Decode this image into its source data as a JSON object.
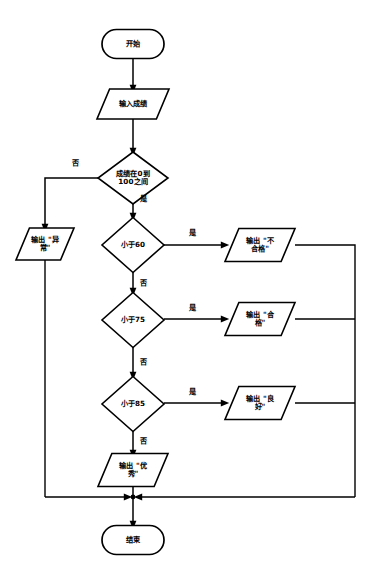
{
  "diagram": {
    "type": "flowchart",
    "language": "zh-CN",
    "background_color": "#ffffff",
    "line_color": "#000000",
    "text_color": "#000000",
    "canvas": {
      "width": 373,
      "height": 580
    }
  },
  "nodes": [
    {
      "id": "start",
      "shape": "terminal",
      "label": "开始",
      "lines": [
        "开始"
      ],
      "cx": 133,
      "cy": 44,
      "w": 62,
      "h": 29
    },
    {
      "id": "input_score",
      "shape": "parallelogram",
      "label": "输入成绩",
      "lines": [
        "输入成绩"
      ],
      "cx": 133,
      "cy": 104,
      "w": 72,
      "h": 30
    },
    {
      "id": "range_check",
      "shape": "diamond",
      "label": "成绩在0到100之间",
      "lines": [
        "成绩在0到",
        "100之间"
      ],
      "cx": 133,
      "cy": 178,
      "w": 70,
      "h": 52
    },
    {
      "id": "out_abnormal",
      "shape": "parallelogram",
      "label": "输出 \"异常\"",
      "lines": [
        "输出 \"异",
        "常\""
      ],
      "cx": 45,
      "cy": 244,
      "w": 58,
      "h": 32
    },
    {
      "id": "lt60",
      "shape": "diamond",
      "label": "小于60",
      "lines": [
        "小于60"
      ],
      "cx": 133,
      "cy": 245,
      "w": 62,
      "h": 55
    },
    {
      "id": "out_fail",
      "shape": "parallelogram",
      "label": "输出 \"不合格\"",
      "lines": [
        "输出 \"不",
        "合格\""
      ],
      "cx": 260,
      "cy": 245,
      "w": 70,
      "h": 33
    },
    {
      "id": "lt75",
      "shape": "diamond",
      "label": "小于75",
      "lines": [
        "小于75"
      ],
      "cx": 133,
      "cy": 320,
      "w": 62,
      "h": 55
    },
    {
      "id": "out_pass",
      "shape": "parallelogram",
      "label": "输出 \"合格\"",
      "lines": [
        "输出 \"合",
        "格\""
      ],
      "cx": 260,
      "cy": 319,
      "w": 70,
      "h": 33
    },
    {
      "id": "lt85",
      "shape": "diamond",
      "label": "小于85",
      "lines": [
        "小于85"
      ],
      "cx": 133,
      "cy": 404,
      "w": 62,
      "h": 55
    },
    {
      "id": "out_good",
      "shape": "parallelogram",
      "label": "输出 \"良好\"",
      "lines": [
        "输出 \"良",
        "好\""
      ],
      "cx": 260,
      "cy": 403,
      "w": 70,
      "h": 33
    },
    {
      "id": "out_excellent",
      "shape": "parallelogram",
      "label": "输出 \"优秀\"",
      "lines": [
        "输出 \"优",
        "秀\""
      ],
      "cx": 133,
      "cy": 470,
      "w": 70,
      "h": 33
    },
    {
      "id": "end",
      "shape": "terminal",
      "label": "结束",
      "lines": [
        "结束"
      ],
      "cx": 133,
      "cy": 540,
      "w": 62,
      "h": 29
    }
  ],
  "edges": [
    {
      "id": "e_start_input",
      "from": "start",
      "to": "input_score",
      "label": "",
      "path": "M133,58.5 L133,87",
      "arrow": {
        "x": 133,
        "y": 89,
        "dir": "down"
      }
    },
    {
      "id": "e_input_range",
      "from": "input_score",
      "to": "range_check",
      "label": "",
      "path": "M133,119 L133,150",
      "arrow": {
        "x": 133,
        "y": 152,
        "dir": "down"
      }
    },
    {
      "id": "e_range_no",
      "from": "range_check",
      "to": "out_abnormal",
      "label": "否",
      "label_x": 75,
      "label_y": 163,
      "path": "M98,178 L45,178 L45,226",
      "arrow": {
        "x": 45,
        "y": 228,
        "dir": "down"
      }
    },
    {
      "id": "e_range_yes",
      "from": "range_check",
      "to": "lt60",
      "label": "是",
      "label_x": 143,
      "label_y": 199,
      "path": "M133,204 L133,215",
      "arrow": {
        "x": 133,
        "y": 217,
        "dir": "down"
      }
    },
    {
      "id": "e_abnormal_rail",
      "from": "out_abnormal",
      "to": "merge",
      "label": "",
      "path": "M45,260 L45,497",
      "arrow": null
    },
    {
      "id": "e_lt60_yes",
      "from": "lt60",
      "to": "out_fail",
      "label": "是",
      "label_x": 192,
      "label_y": 233,
      "path": "M164,245 L223,245",
      "arrow": {
        "x": 225,
        "y": 245,
        "dir": "right"
      }
    },
    {
      "id": "e_lt60_no",
      "from": "lt60",
      "to": "lt75",
      "label": "否",
      "label_x": 143,
      "label_y": 283,
      "path": "M133,272 L133,290",
      "arrow": {
        "x": 133,
        "y": 292,
        "dir": "down"
      }
    },
    {
      "id": "e_fail_rail",
      "from": "out_fail",
      "to": "rail_right",
      "label": "",
      "path": "M295,245 L355,245 L355,497",
      "arrow": null
    },
    {
      "id": "e_lt75_yes",
      "from": "lt75",
      "to": "out_pass",
      "label": "是",
      "label_x": 192,
      "label_y": 308,
      "path": "M164,319 L223,319",
      "arrow": {
        "x": 225,
        "y": 319,
        "dir": "right"
      }
    },
    {
      "id": "e_lt75_no",
      "from": "lt75",
      "to": "lt85",
      "label": "否",
      "label_x": 143,
      "label_y": 362,
      "path": "M133,347 L133,374",
      "arrow": {
        "x": 133,
        "y": 376,
        "dir": "down"
      }
    },
    {
      "id": "e_pass_rail",
      "from": "out_pass",
      "to": "rail_right",
      "label": "",
      "path": "M295,319 L355,319",
      "arrow": null
    },
    {
      "id": "e_lt85_yes",
      "from": "lt85",
      "to": "out_good",
      "label": "是",
      "label_x": 192,
      "label_y": 392,
      "path": "M164,403 L223,403",
      "arrow": {
        "x": 225,
        "y": 403,
        "dir": "right"
      }
    },
    {
      "id": "e_lt85_no",
      "from": "lt85",
      "to": "out_excellent",
      "label": "否",
      "label_x": 143,
      "label_y": 441,
      "path": "M133,431 L133,452",
      "arrow": {
        "x": 133,
        "y": 454,
        "dir": "down"
      }
    },
    {
      "id": "e_good_rail",
      "from": "out_good",
      "to": "rail_right",
      "label": "",
      "path": "M295,403 L355,403",
      "arrow": null
    },
    {
      "id": "e_excellent_end",
      "from": "out_excellent",
      "to": "end",
      "label": "",
      "path": "M133,486 L133,523",
      "arrow": {
        "x": 133,
        "y": 525,
        "dir": "down"
      }
    },
    {
      "id": "e_merge_left",
      "from": "rail_left",
      "to": "merge",
      "label": "",
      "path": "M45,497 L126,497",
      "arrow": {
        "x": 128,
        "y": 497,
        "dir": "right"
      }
    },
    {
      "id": "e_merge_right",
      "from": "rail_right",
      "to": "merge",
      "label": "",
      "path": "M355,497 L140,497",
      "arrow": {
        "x": 138,
        "y": 497,
        "dir": "left"
      }
    }
  ],
  "junctions": [
    {
      "id": "merge-junction",
      "x": 133,
      "y": 497,
      "r": 2.4
    }
  ],
  "legend": {
    "yes_label": "是",
    "no_label": "否"
  }
}
